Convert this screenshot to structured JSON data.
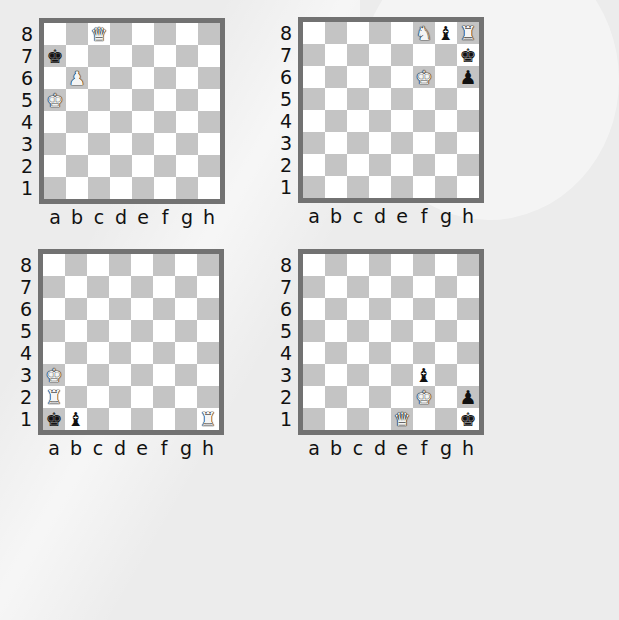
{
  "ranks": [
    "8",
    "7",
    "6",
    "5",
    "4",
    "3",
    "2",
    "1"
  ],
  "files": [
    "a",
    "b",
    "c",
    "d",
    "e",
    "f",
    "g",
    "h"
  ],
  "colors": {
    "dark_square": "#c4c4c4",
    "light_square": "#ffffff",
    "border": "#727272",
    "background": "#ececec"
  },
  "piece_glyphs": {
    "K": "♚",
    "Q": "♛",
    "R": "♜",
    "B": "♝",
    "N": "♞",
    "P": "♟"
  },
  "diagrams": [
    {
      "id": "top-left",
      "pieces": [
        {
          "square": "c8",
          "type": "Q",
          "color": "white",
          "name": "white-queen"
        },
        {
          "square": "a7",
          "type": "K",
          "color": "black",
          "name": "black-king"
        },
        {
          "square": "b6",
          "type": "P",
          "color": "white",
          "name": "white-pawn"
        },
        {
          "square": "a5",
          "type": "K",
          "color": "white",
          "name": "white-king"
        }
      ]
    },
    {
      "id": "top-right",
      "pieces": [
        {
          "square": "f8",
          "type": "N",
          "color": "white",
          "name": "white-knight"
        },
        {
          "square": "g8",
          "type": "B",
          "color": "black",
          "name": "black-bishop"
        },
        {
          "square": "h8",
          "type": "R",
          "color": "white",
          "name": "white-rook"
        },
        {
          "square": "h7",
          "type": "K",
          "color": "black",
          "name": "black-king"
        },
        {
          "square": "f6",
          "type": "K",
          "color": "white",
          "name": "white-king"
        },
        {
          "square": "h6",
          "type": "P",
          "color": "black",
          "name": "black-pawn"
        }
      ]
    },
    {
      "id": "bottom-left",
      "pieces": [
        {
          "square": "a3",
          "type": "K",
          "color": "white",
          "name": "white-king"
        },
        {
          "square": "a2",
          "type": "R",
          "color": "white",
          "name": "white-rook"
        },
        {
          "square": "a1",
          "type": "K",
          "color": "black",
          "name": "black-king"
        },
        {
          "square": "b1",
          "type": "B",
          "color": "black",
          "name": "black-bishop"
        },
        {
          "square": "h1",
          "type": "R",
          "color": "white",
          "name": "white-rook"
        }
      ]
    },
    {
      "id": "bottom-right",
      "pieces": [
        {
          "square": "f3",
          "type": "B",
          "color": "black",
          "name": "black-bishop"
        },
        {
          "square": "f2",
          "type": "K",
          "color": "white",
          "name": "white-king"
        },
        {
          "square": "h2",
          "type": "P",
          "color": "black",
          "name": "black-pawn"
        },
        {
          "square": "e1",
          "type": "Q",
          "color": "white",
          "name": "white-queen"
        },
        {
          "square": "h1",
          "type": "K",
          "color": "black",
          "name": "black-king"
        }
      ]
    }
  ]
}
